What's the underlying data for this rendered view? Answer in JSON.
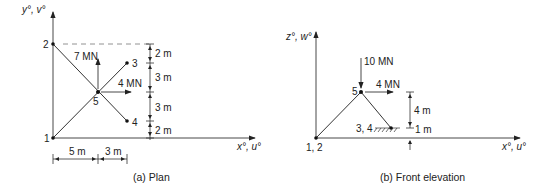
{
  "plan": {
    "axis_y_label": "y°, v°",
    "axis_x_label": "x°, u°",
    "nodes": {
      "n1": "1",
      "n2": "2",
      "n3": "3",
      "n4": "4",
      "n5": "5"
    },
    "force_vertical": "7 MN",
    "force_horizontal": "4 MN",
    "dims_vertical": [
      "2 m",
      "3 m",
      "3 m",
      "2 m"
    ],
    "dims_horizontal": [
      "5 m",
      "3 m"
    ],
    "caption": "(a)  Plan"
  },
  "elevation": {
    "axis_z_label": "z°, w°",
    "axis_x_label": "x°, u°",
    "nodes": {
      "n12": "1, 2",
      "n34": "3, 4",
      "n5": "5"
    },
    "force_vertical": "10 MN",
    "force_horizontal": "4 MN",
    "dims_vertical": [
      "4 m",
      "1 m"
    ],
    "caption": "(b)  Front elevation"
  },
  "colors": {
    "line": "#333333",
    "dash": "#777777"
  }
}
